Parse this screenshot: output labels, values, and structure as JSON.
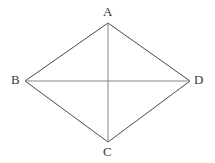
{
  "figure": {
    "shape_type": "quadrilateral",
    "background_color": "#ffffff",
    "stroke_color_outline": "#4a4a4a",
    "stroke_color_diagonal": "#808080",
    "stroke_width": 1,
    "canvas": {
      "width": 215,
      "height": 163
    },
    "vertices": [
      {
        "name": "A",
        "label": "A",
        "x": 108,
        "y": 23,
        "label_x": 103,
        "label_y": 5
      },
      {
        "name": "B",
        "label": "B",
        "x": 25,
        "y": 81,
        "label_x": 11,
        "label_y": 73
      },
      {
        "name": "C",
        "label": "C",
        "x": 108,
        "y": 142,
        "label_x": 103,
        "label_y": 145
      },
      {
        "name": "D",
        "label": "D",
        "x": 190,
        "y": 81,
        "label_x": 194,
        "label_y": 73
      }
    ],
    "edges": [
      {
        "name": "AB",
        "from": "A",
        "to": "B",
        "kind": "side"
      },
      {
        "name": "BC",
        "from": "B",
        "to": "C",
        "kind": "side"
      },
      {
        "name": "CD",
        "from": "C",
        "to": "D",
        "kind": "side"
      },
      {
        "name": "DA",
        "from": "D",
        "to": "A",
        "kind": "side"
      }
    ],
    "diagonals": [
      {
        "name": "AC",
        "from": "A",
        "to": "C",
        "orientation": "vertical"
      },
      {
        "name": "BD",
        "from": "B",
        "to": "D",
        "orientation": "horizontal"
      }
    ],
    "intersection": {
      "name": "center",
      "x": 108,
      "y": 81
    }
  }
}
